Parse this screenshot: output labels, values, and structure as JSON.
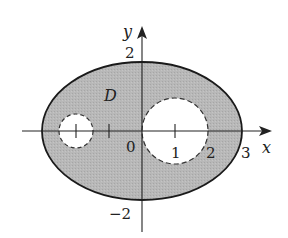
{
  "figure": {
    "region_label": "D",
    "axis_labels": {
      "x": "x",
      "y": "y"
    },
    "origin_label": "0",
    "x_tick_labels": [
      {
        "value": 1,
        "label": "1"
      },
      {
        "value": 2,
        "label": "2"
      },
      {
        "value": 3,
        "label": "3"
      }
    ],
    "y_tick_labels": [
      {
        "value": 2,
        "label": "2"
      },
      {
        "value": -2,
        "label": "−2"
      }
    ],
    "x_tick_marks": [
      -2,
      -1,
      1
    ],
    "colors": {
      "region_fill": "#b4b4b4",
      "outline": "#1a1a1a",
      "holes": "#ffffff"
    }
  }
}
